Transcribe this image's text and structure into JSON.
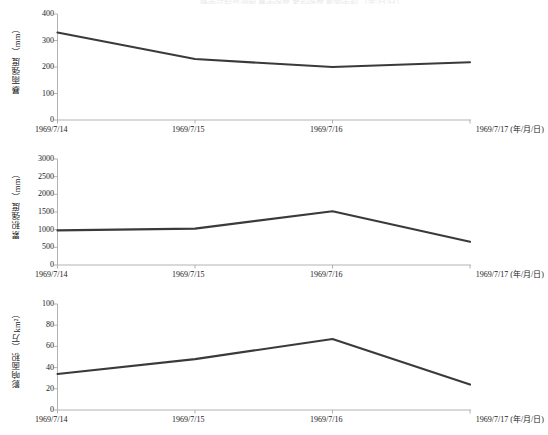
{
  "figure": {
    "background_color": "#ffffff",
    "line_color": "#3a3a3a",
    "axis_color": "#aaaaaa",
    "text_color": "#1a1a1a",
    "truncated_header_text": "降雨过程监测图 暴雨强度 累积强度 影响面积 （年/月/日）"
  },
  "chart_data": [
    {
      "type": "line",
      "title": "",
      "xlabel": "1969/7/17 (年/月/日)",
      "ylabel": "暴雨强度（mm）",
      "categories": [
        "1969/7/14",
        "1969/7/15",
        "1969/7/16",
        "1969/7/17"
      ],
      "x_tick_labels": [
        "1969/7/14",
        "1969/7/15",
        "1969/7/16",
        "1969/7/17 (年/月/日)"
      ],
      "y_tick_labels": [
        "0",
        "100",
        "200",
        "300",
        "400"
      ],
      "y_ticks": [
        0,
        100,
        200,
        300,
        400
      ],
      "ylim": [
        0,
        400
      ],
      "values": [
        330,
        230,
        200,
        218
      ],
      "grid": false,
      "legend": "none"
    },
    {
      "type": "line",
      "title": "",
      "xlabel": "1969/7/17 (年/月/日)",
      "ylabel": "累积强度（mm）",
      "categories": [
        "1969/7/14",
        "1969/7/15",
        "1969/7/16",
        "1969/7/17"
      ],
      "x_tick_labels": [
        "1969/7/14",
        "1969/7/15",
        "1969/7/16",
        "1969/7/17 (年/月/日)"
      ],
      "y_tick_labels": [
        "0",
        "500",
        "1000",
        "1500",
        "2000",
        "2500",
        "3000"
      ],
      "y_ticks": [
        0,
        500,
        1000,
        1500,
        2000,
        2500,
        3000
      ],
      "ylim": [
        0,
        3000
      ],
      "values": [
        980,
        1030,
        1520,
        660
      ],
      "grid": false,
      "legend": "none"
    },
    {
      "type": "line",
      "title": "",
      "xlabel": "1969/7/17 (年/月/日)",
      "ylabel": "影响面积（万km²）",
      "categories": [
        "1969/7/14",
        "1969/7/15",
        "1969/7/16",
        "1969/7/17"
      ],
      "x_tick_labels": [
        "1969/7/14",
        "1969/7/15",
        "1969/7/16",
        "1969/7/17 (年/月/日)"
      ],
      "y_tick_labels": [
        "0",
        "20",
        "40",
        "60",
        "80",
        "100"
      ],
      "y_ticks": [
        0,
        20,
        40,
        60,
        80,
        100
      ],
      "ylim": [
        0,
        100
      ],
      "values": [
        34,
        48,
        67,
        24
      ],
      "grid": false,
      "legend": "none"
    }
  ]
}
